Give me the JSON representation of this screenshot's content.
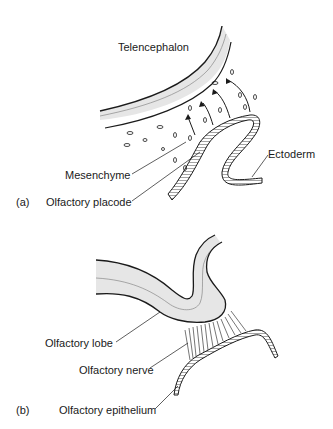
{
  "figure": {
    "panel_a": {
      "tag": "(a)",
      "labels": {
        "telencephalon": "Telencephalon",
        "mesenchyme": "Mesenchyme",
        "ectoderm": "Ectoderm",
        "olfactory_placode": "Olfactory placode"
      }
    },
    "panel_b": {
      "tag": "(b)",
      "labels": {
        "olfactory_lobe": "Olfactory lobe",
        "olfactory_nerve": "Olfactory nerve",
        "olfactory_epithelium": "Olfactory epithelium"
      }
    },
    "colors": {
      "line": "#1a1a1a",
      "tissue_fill": "#e6e6e6",
      "background": "#ffffff"
    }
  }
}
